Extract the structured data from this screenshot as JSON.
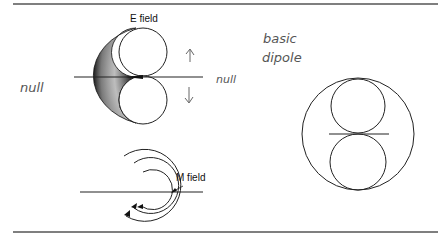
{
  "diagram": {
    "labels": {
      "e_field": "E field",
      "m_field": "M field"
    },
    "annotations": {
      "null_left": "null",
      "null_right": "null",
      "basic": "basic",
      "dipole": "dipole",
      "arrow_up": "↑",
      "arrow_down": "↓"
    },
    "colors": {
      "line": "#222222",
      "rule": "#555555",
      "handwriting": "#555555"
    }
  }
}
